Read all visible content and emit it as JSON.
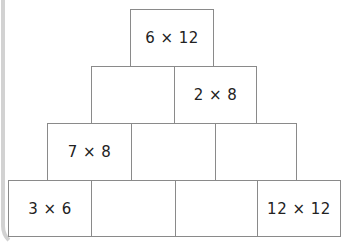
{
  "pyramid": {
    "rows": [
      {
        "cells": [
          "6 × 12"
        ]
      },
      {
        "cells": [
          "",
          "2 × 8"
        ]
      },
      {
        "cells": [
          "7 × 8",
          "",
          ""
        ]
      },
      {
        "cells": [
          "3 × 6",
          "",
          "",
          "12 × 12"
        ]
      }
    ]
  },
  "colors": {
    "border": "#8a8a8a",
    "panel_edge": "#d2d2d2",
    "text": "#222222"
  }
}
